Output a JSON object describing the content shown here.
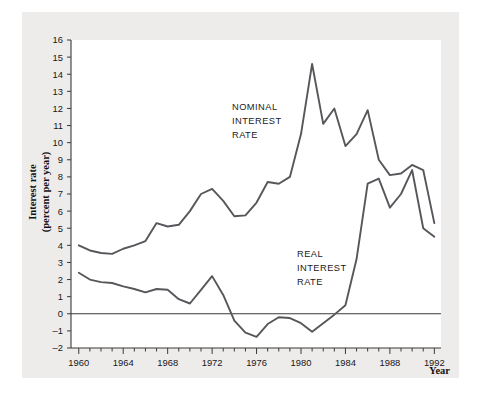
{
  "figure": {
    "background": "#eeecea",
    "plot_background": "#ffffff",
    "line_color": "#58565a",
    "axis_color": "#3a3a3a"
  },
  "chart_data": {
    "type": "line",
    "title": "",
    "xlabel": "Year",
    "ylabel": "Interest rate (percent per year)",
    "ylabel_line1": "Interest rate",
    "ylabel_line2": "(percent per year)",
    "xlim": [
      1959.3,
      1992.6
    ],
    "ylim": [
      -2,
      16
    ],
    "grid": false,
    "legend_position": "inline-annotation",
    "y_ticks": [
      -2,
      -1,
      0,
      1,
      2,
      3,
      4,
      5,
      6,
      7,
      8,
      9,
      10,
      11,
      12,
      13,
      14,
      15,
      16
    ],
    "x_ticks_major": [
      1960,
      1964,
      1968,
      1972,
      1976,
      1980,
      1984,
      1988,
      1992
    ],
    "x_ticks_minor_step": 1,
    "x": [
      1960,
      1961,
      1962,
      1963,
      1964,
      1965,
      1966,
      1967,
      1968,
      1969,
      1970,
      1971,
      1972,
      1973,
      1974,
      1975,
      1976,
      1977,
      1978,
      1979,
      1980,
      1981,
      1982,
      1983,
      1984,
      1985,
      1986,
      1987,
      1988,
      1989,
      1990,
      1991,
      1992
    ],
    "series": [
      {
        "name": "NOMINAL INTEREST RATE",
        "label_lines": [
          "NOMINAL",
          "INTEREST",
          "RATE"
        ],
        "values": [
          4.0,
          3.7,
          3.5,
          3.6,
          3.8,
          4.0,
          4.3,
          5.3,
          5.1,
          5.6,
          6.2,
          7.3,
          7.0,
          5.7,
          5.8,
          6.4,
          7.6,
          8.0,
          10.5,
          14.6,
          12.1,
          11.0,
          12.0,
          10.0,
          8.5,
          8.0,
          8.9,
          9.1,
          8.7,
          7.5,
          5.3,
          4.7,
          3.9
        ]
      },
      {
        "name": "REAL INTEREST RATE",
        "label_lines": [
          "REAL",
          "INTEREST",
          "RATE"
        ],
        "values": [
          2.4,
          2.0,
          1.8,
          1.9,
          1.7,
          1.5,
          1.3,
          1.2,
          1.4,
          1.4,
          0.9,
          0.6,
          0.8,
          1.6,
          2.2,
          1.2,
          -0.1,
          -0.9,
          -1.3,
          -0.7,
          -0.3,
          -0.2,
          -0.3,
          -0.8,
          -0.3,
          1.0,
          3.6,
          7.9,
          7.2,
          6.1,
          8.3,
          5.6,
          4.0
        ]
      }
    ],
    "nominal_plot_points": [
      [
        1960,
        4.0
      ],
      [
        1961,
        3.7
      ],
      [
        1962,
        3.55
      ],
      [
        1963,
        3.5
      ],
      [
        1964,
        3.8
      ],
      [
        1965,
        4.0
      ],
      [
        1966,
        4.25
      ],
      [
        1967,
        5.3
      ],
      [
        1968,
        5.1
      ],
      [
        1969,
        5.2
      ],
      [
        1970,
        6.0
      ],
      [
        1971,
        7.0
      ],
      [
        1972,
        7.3
      ],
      [
        1973,
        6.6
      ],
      [
        1974,
        5.7
      ],
      [
        1975,
        5.75
      ],
      [
        1976,
        6.5
      ],
      [
        1977,
        7.7
      ],
      [
        1978,
        7.6
      ],
      [
        1979,
        8.0
      ],
      [
        1980,
        10.5
      ],
      [
        1981,
        14.6
      ],
      [
        1982,
        11.1
      ],
      [
        1983,
        12.0
      ],
      [
        1984,
        9.8
      ],
      [
        1985,
        10.5
      ],
      [
        1986,
        11.9
      ],
      [
        1987,
        9.0
      ],
      [
        1988,
        8.1
      ],
      [
        1989,
        8.2
      ],
      [
        1990,
        8.7
      ],
      [
        1991,
        8.4
      ],
      [
        1992,
        5.3
      ]
    ],
    "real_plot_points": [
      [
        1960,
        2.4
      ],
      [
        1961,
        2.0
      ],
      [
        1962,
        1.85
      ],
      [
        1963,
        1.8
      ],
      [
        1964,
        1.6
      ],
      [
        1965,
        1.45
      ],
      [
        1966,
        1.25
      ],
      [
        1967,
        1.45
      ],
      [
        1968,
        1.4
      ],
      [
        1969,
        0.85
      ],
      [
        1970,
        0.6
      ],
      [
        1971,
        1.4
      ],
      [
        1972,
        2.2
      ],
      [
        1973,
        1.1
      ],
      [
        1974,
        -0.4
      ],
      [
        1975,
        -1.1
      ],
      [
        1976,
        -1.35
      ],
      [
        1977,
        -0.6
      ],
      [
        1978,
        -0.2
      ],
      [
        1979,
        -0.25
      ],
      [
        1980,
        -0.55
      ],
      [
        1981,
        -1.05
      ],
      [
        1982,
        -0.55
      ],
      [
        1983,
        -0.05
      ],
      [
        1984,
        0.5
      ],
      [
        1985,
        3.2
      ],
      [
        1986,
        7.6
      ],
      [
        1987,
        7.9
      ],
      [
        1988,
        6.2
      ],
      [
        1989,
        7.0
      ],
      [
        1990,
        8.4
      ],
      [
        1991,
        5.0
      ],
      [
        1992,
        4.5
      ]
    ]
  }
}
